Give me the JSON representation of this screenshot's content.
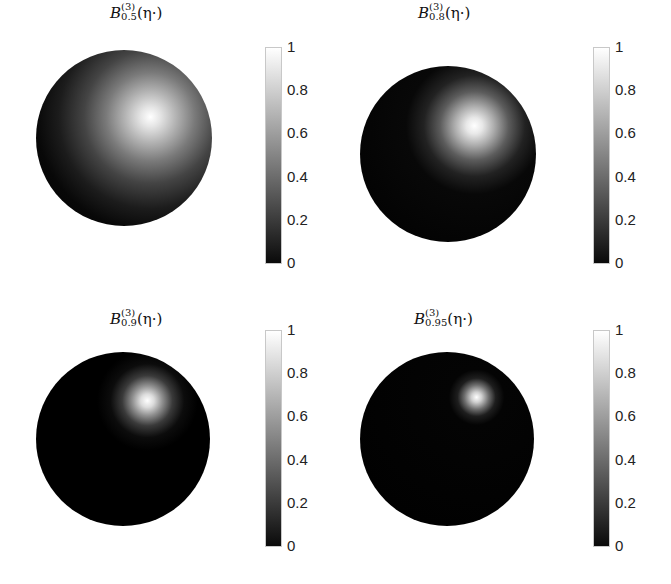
{
  "chart_data": [
    {
      "type": "heatmap",
      "title": "B_{0.5}^{(3)}(η·)",
      "title_parts": {
        "base": "B",
        "sup": "(3)",
        "sub": "0.5",
        "arg": "(η·)"
      },
      "description": "Sphere surface shaded by function value; bright spot upper-right, broad spread",
      "peak_value": 1,
      "spread": "wide",
      "colorbar": {
        "min": 0,
        "max": 1,
        "ticks": [
          "0",
          "0.2",
          "0.4",
          "0.6",
          "0.8",
          "1"
        ],
        "colormap": "gray"
      }
    },
    {
      "type": "heatmap",
      "title": "B_{0.8}^{(3)}(η·)",
      "title_parts": {
        "base": "B",
        "sup": "(3)",
        "sub": "0.8",
        "arg": "(η·)"
      },
      "description": "Sphere surface shaded by function value; bright spot upper-right, medium spread",
      "peak_value": 1,
      "spread": "medium",
      "colorbar": {
        "min": 0,
        "max": 1,
        "ticks": [
          "0",
          "0.2",
          "0.4",
          "0.6",
          "0.8",
          "1"
        ],
        "colormap": "gray"
      }
    },
    {
      "type": "heatmap",
      "title": "B_{0.9}^{(3)}(η·)",
      "title_parts": {
        "base": "B",
        "sup": "(3)",
        "sub": "0.9",
        "arg": "(η·)"
      },
      "description": "Sphere surface shaded by function value; bright spot upper-right, narrow spread",
      "peak_value": 1,
      "spread": "narrow",
      "colorbar": {
        "min": 0,
        "max": 1,
        "ticks": [
          "0",
          "0.2",
          "0.4",
          "0.6",
          "0.8",
          "1"
        ],
        "colormap": "gray"
      }
    },
    {
      "type": "heatmap",
      "title": "B_{0.95}^{(3)}(η·)",
      "title_parts": {
        "base": "B",
        "sup": "(3)",
        "sub": "0.95",
        "arg": "(η·)"
      },
      "description": "Sphere surface shaded by function value; bright spot upper-right, very narrow spread",
      "peak_value": 1,
      "spread": "very narrow",
      "colorbar": {
        "min": 0,
        "max": 1,
        "ticks": [
          "0",
          "0.2",
          "0.4",
          "0.6",
          "0.8",
          "1"
        ],
        "colormap": "gray"
      }
    }
  ],
  "panels": [
    {
      "base": "B",
      "sup": "(3)",
      "sub": "0.5",
      "arg": "(η·)"
    },
    {
      "base": "B",
      "sup": "(3)",
      "sub": "0.8",
      "arg": "(η·)"
    },
    {
      "base": "B",
      "sup": "(3)",
      "sub": "0.9",
      "arg": "(η·)"
    },
    {
      "base": "B",
      "sup": "(3)",
      "sub": "0.95",
      "arg": "(η·)"
    }
  ],
  "ticks": [
    "1",
    "0.8",
    "0.6",
    "0.4",
    "0.2",
    "0"
  ]
}
